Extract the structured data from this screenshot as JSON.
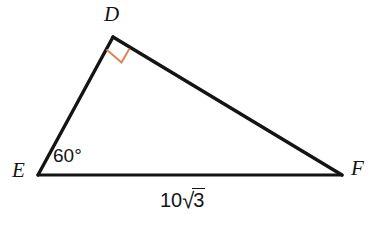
{
  "figure": {
    "kind": "geometry-diagram",
    "shape": "triangle",
    "background_color": "#ffffff",
    "stroke_color": "#141414",
    "stroke_width": 3.2,
    "right_angle_marker_color": "#e08050"
  },
  "vertices": {
    "D": {
      "label": "D",
      "x": 113,
      "y": 37
    },
    "E": {
      "label": "E",
      "x": 38,
      "y": 175
    },
    "F": {
      "label": "F",
      "x": 342,
      "y": 175
    }
  },
  "labels": {
    "vertex_d": "D",
    "vertex_e": "E",
    "vertex_f": "F",
    "angle_at_e": "60°",
    "side_ef_coefficient": "10",
    "side_ef_radical_sign": "√",
    "side_ef_radicand": "3",
    "side_ef_full": "10√3"
  },
  "annotations": {
    "right_angle_vertex": "D",
    "right_angle_measure": "90°",
    "labeled_angle_vertex": "E",
    "labeled_angle_measure": "60°",
    "labeled_side": "EF",
    "labeled_side_length": "10√3"
  }
}
